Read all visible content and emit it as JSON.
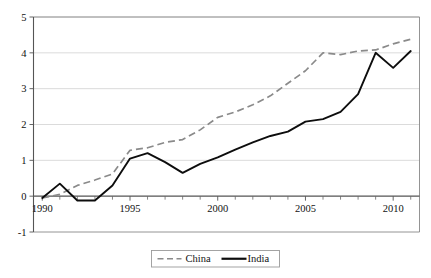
{
  "chart_data": {
    "type": "line",
    "title": "",
    "subtitle": "",
    "xlabel": "",
    "ylabel": "",
    "xlim": [
      1989.5,
      2011.5
    ],
    "ylim": [
      -1,
      5
    ],
    "x_ticks": [
      1990,
      1995,
      2000,
      2005,
      2010
    ],
    "x_tick_labels": [
      "1990",
      "1995",
      "2000",
      "2005",
      "2010"
    ],
    "x_minor_ticks": [
      1991,
      1992,
      1993,
      1994,
      1996,
      1997,
      1998,
      1999,
      2001,
      2002,
      2003,
      2004,
      2006,
      2007,
      2008,
      2009,
      2011
    ],
    "y_ticks": [
      -1,
      0,
      1,
      2,
      3,
      4,
      5
    ],
    "y_tick_labels": [
      "-1",
      "0",
      "1",
      "2",
      "3",
      "4",
      "5"
    ],
    "grid": "horizontal",
    "legend_position": "bottom-center",
    "x": [
      1990,
      1991,
      1992,
      1993,
      1994,
      1995,
      1996,
      1997,
      1998,
      1999,
      2000,
      2001,
      2002,
      2003,
      2004,
      2005,
      2006,
      2007,
      2008,
      2009,
      2010,
      2011
    ],
    "series": [
      {
        "name": "China",
        "style": "dashed",
        "color": "#8a8a8a",
        "values": [
          -0.05,
          0.05,
          0.3,
          0.45,
          0.62,
          1.28,
          1.35,
          1.5,
          1.58,
          1.85,
          2.2,
          2.35,
          2.55,
          2.8,
          3.15,
          3.5,
          4.0,
          3.95,
          4.05,
          4.08,
          4.25,
          4.38
        ]
      },
      {
        "name": "India",
        "style": "solid",
        "color": "#0d0d0d",
        "values": [
          -0.05,
          0.35,
          -0.12,
          -0.12,
          0.3,
          1.05,
          1.2,
          0.95,
          0.65,
          0.9,
          1.08,
          1.3,
          1.5,
          1.68,
          1.8,
          2.08,
          2.15,
          2.35,
          2.85,
          4.0,
          3.58,
          4.05
        ]
      }
    ]
  },
  "legend": {
    "items": [
      {
        "label": "China"
      },
      {
        "label": "India"
      }
    ]
  }
}
